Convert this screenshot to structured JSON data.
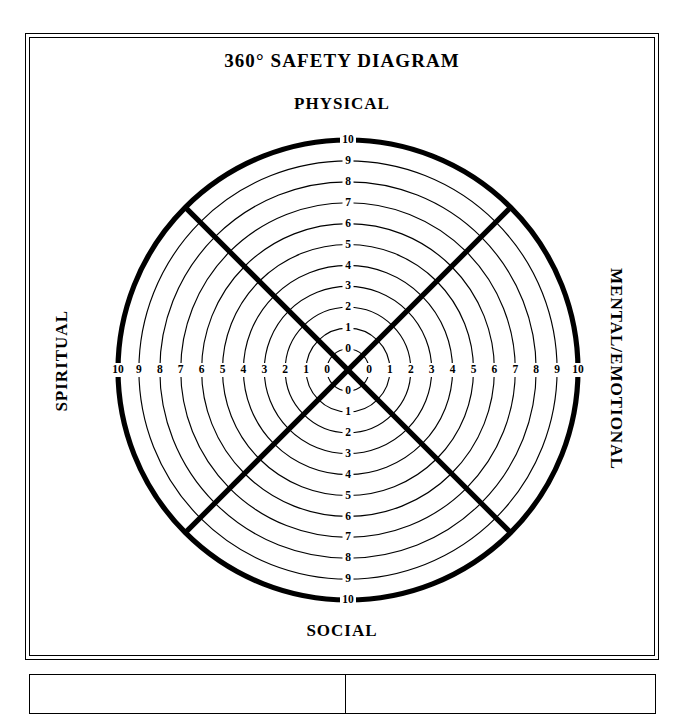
{
  "document": {
    "title": "360° SAFETY DIAGRAM"
  },
  "diagram": {
    "title": "360° SAFETY DIAGRAM",
    "type": "radar-wheel",
    "axes": {
      "top": "PHYSICAL",
      "right": "MENTAL/EMOTIONAL",
      "bottom": "SOCIAL",
      "left": "SPIRITUAL"
    },
    "scale": {
      "min": 0,
      "max": 10,
      "ring_count": 11,
      "tick_labels_up": [
        "10",
        "9",
        "8",
        "7",
        "6",
        "5",
        "4",
        "3",
        "2",
        "1",
        "0"
      ],
      "tick_labels_down": [
        "0",
        "1",
        "2",
        "3",
        "4",
        "5",
        "6",
        "7",
        "8",
        "9",
        "10"
      ],
      "tick_labels_left": [
        "10",
        "9",
        "8",
        "7",
        "6",
        "5",
        "4",
        "3",
        "2",
        "1",
        "0"
      ],
      "tick_labels_right": [
        "0",
        "1",
        "2",
        "3",
        "4",
        "5",
        "6",
        "7",
        "8",
        "9",
        "10"
      ]
    },
    "geometry": {
      "center_x": 348,
      "center_y": 370,
      "outer_radius": 230,
      "ring_step": 20.9,
      "inner_radius": 21
    },
    "colors": {
      "ink": "#000000",
      "paper": "#ffffff"
    }
  },
  "chart_data": {
    "type": "radar",
    "title": "360° SAFETY DIAGRAM",
    "categories": [
      "PHYSICAL",
      "MENTAL/EMOTIONAL",
      "SOCIAL",
      "SPIRITUAL"
    ],
    "series": [],
    "rlim": [
      0,
      10
    ],
    "rticks": [
      0,
      1,
      2,
      3,
      4,
      5,
      6,
      7,
      8,
      9,
      10
    ],
    "grid": true,
    "legend": "none",
    "note": "blank worksheet - no data plotted"
  },
  "bottom_table": {
    "left_cell": "",
    "right_cell": ""
  }
}
